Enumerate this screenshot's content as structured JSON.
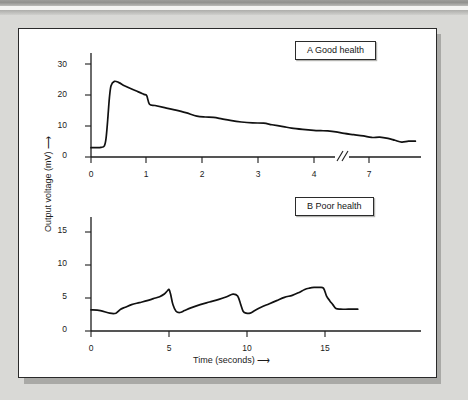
{
  "figure": {
    "panel_background": "#ffffff",
    "page_background": "#d9d9d6",
    "line_color": "#111111"
  },
  "chart_data": [
    {
      "type": "line",
      "title": "A Good health",
      "panel": "A",
      "xlabel": "",
      "ylabel": "Output voltage (mV)",
      "xlim": [
        0,
        7.9
      ],
      "ylim": [
        0,
        33
      ],
      "xticks": [
        0,
        1,
        2,
        3,
        4,
        7
      ],
      "xticklabels": [
        "0",
        "1",
        "2",
        "3",
        "4",
        "7"
      ],
      "yticks": [
        0,
        10,
        20,
        30
      ],
      "yticklabels": [
        "0",
        "10",
        "20",
        "30"
      ],
      "axis_break": {
        "present": true,
        "symbol": "//",
        "between": [
          4,
          7
        ],
        "at_x": 5.45
      },
      "grid": false,
      "legend_position": "top-right",
      "x": [
        0.0,
        0.1,
        0.18,
        0.24,
        0.27,
        0.3,
        0.33,
        0.36,
        0.42,
        0.5,
        0.6,
        0.72,
        0.85,
        0.95,
        1.0,
        1.05,
        1.15,
        1.3,
        1.5,
        1.7,
        1.9,
        2.05,
        2.2,
        2.35,
        2.5,
        2.7,
        2.9,
        3.1,
        3.25,
        3.45,
        3.6,
        3.8,
        4.0,
        4.25,
        4.5,
        4.8,
        5.1,
        5.45,
        5.8,
        6.1,
        6.4,
        6.7,
        6.95,
        7.2,
        7.45,
        7.7
      ],
      "y": [
        3.0,
        3.0,
        3.1,
        3.6,
        6.0,
        12.0,
        19.0,
        23.0,
        24.4,
        24.0,
        23.0,
        22.0,
        21.0,
        20.2,
        19.8,
        17.0,
        16.6,
        16.0,
        15.2,
        14.3,
        13.2,
        12.9,
        12.8,
        12.3,
        11.8,
        11.3,
        11.0,
        10.9,
        10.4,
        9.8,
        9.3,
        8.9,
        8.6,
        8.5,
        8.4,
        8.1,
        7.6,
        7.2,
        6.8,
        6.3,
        6.4,
        6.0,
        5.4,
        4.8,
        5.1,
        5.1
      ]
    },
    {
      "type": "line",
      "title": "B Poor health",
      "panel": "B",
      "xlabel": "Time (seconds)",
      "ylabel": "Output voltage (mV)",
      "xlim": [
        0,
        17.5
      ],
      "ylim": [
        0,
        17
      ],
      "xticks": [
        0,
        5,
        10,
        15
      ],
      "xticklabels": [
        "0",
        "5",
        "10",
        "15"
      ],
      "yticks": [
        0,
        5,
        10,
        15
      ],
      "yticklabels": [
        "0",
        "5",
        "10",
        "15"
      ],
      "axis_break": {
        "present": false
      },
      "grid": false,
      "legend_position": "top-right",
      "x": [
        0.0,
        0.6,
        1.2,
        1.6,
        1.9,
        2.2,
        2.6,
        3.1,
        3.6,
        4.0,
        4.4,
        4.7,
        4.9,
        5.0,
        5.1,
        5.25,
        5.45,
        5.7,
        6.0,
        6.4,
        7.0,
        7.6,
        8.2,
        8.7,
        9.1,
        9.4,
        9.6,
        9.75,
        9.95,
        10.2,
        10.5,
        10.9,
        11.4,
        11.9,
        12.4,
        12.9,
        13.3,
        13.7,
        14.0,
        14.3,
        14.6,
        14.9,
        15.1,
        15.3,
        15.5,
        15.7,
        16.0,
        16.5,
        17.1
      ],
      "y": [
        3.2,
        3.1,
        2.7,
        2.7,
        3.3,
        3.6,
        4.0,
        4.3,
        4.6,
        4.9,
        5.2,
        5.6,
        6.1,
        6.3,
        5.6,
        4.0,
        3.0,
        2.8,
        3.1,
        3.5,
        4.0,
        4.4,
        4.8,
        5.2,
        5.6,
        5.3,
        4.0,
        3.0,
        2.7,
        2.7,
        3.1,
        3.6,
        4.1,
        4.6,
        5.1,
        5.4,
        5.8,
        6.3,
        6.5,
        6.6,
        6.6,
        6.5,
        5.3,
        4.6,
        4.0,
        3.4,
        3.3,
        3.3,
        3.3
      ]
    }
  ]
}
